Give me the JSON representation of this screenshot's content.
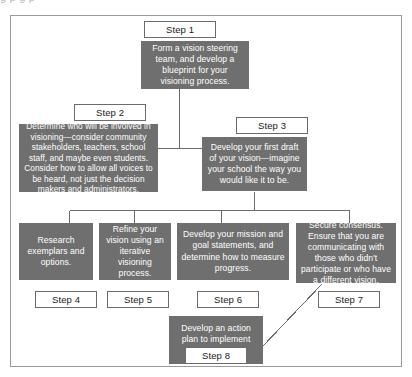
{
  "page": {
    "clipped_caption": "g        p        g                                     p",
    "frame_color": "#9a9a9a",
    "box_fill": "#6f6f6f",
    "box_text_color": "#ffffff",
    "label_border_color": "#6b6b6b",
    "connector_color": "#6b6b6b"
  },
  "diagram": {
    "type": "flowchart",
    "nodes": [
      {
        "id": "step1",
        "label": "Step 1",
        "text": "Form a vision steering team, and develop a blueprint for your visioning process."
      },
      {
        "id": "step2",
        "label": "Step 2",
        "text": "Determine who will be involved in visioning—consider community stakeholders, teachers, school staff, and maybe even students. Consider how to allow all voices to be heard, not just the decision makers and administrators."
      },
      {
        "id": "step3",
        "label": "Step 3",
        "text": "Develop your first draft of your vision—imagine your school the way you would like it to be."
      },
      {
        "id": "step4",
        "label": "Step 4",
        "text": "Research exemplars and options."
      },
      {
        "id": "step5",
        "label": "Step 5",
        "text": "Refine your vision using an iterative visioning process."
      },
      {
        "id": "step6",
        "label": "Step 6",
        "text": "Develop your mission and goal statements, and determine how to measure progress."
      },
      {
        "id": "step7",
        "label": "Step 7",
        "text": "Secure consensus. Ensure that you are communicating with those who didn't participate or who have a different vision."
      },
      {
        "id": "step8",
        "label": "Step 8",
        "text": "Develop an action plan to implement your vision."
      }
    ],
    "edges": [
      {
        "from": "step1",
        "to": "step2"
      },
      {
        "from": "step1",
        "to": "step3"
      },
      {
        "from": "step3",
        "to": "step4"
      },
      {
        "from": "step3",
        "to": "step5"
      },
      {
        "from": "step3",
        "to": "step6"
      },
      {
        "from": "step3",
        "to": "step7"
      },
      {
        "from": "step7",
        "to": "step8"
      }
    ]
  }
}
